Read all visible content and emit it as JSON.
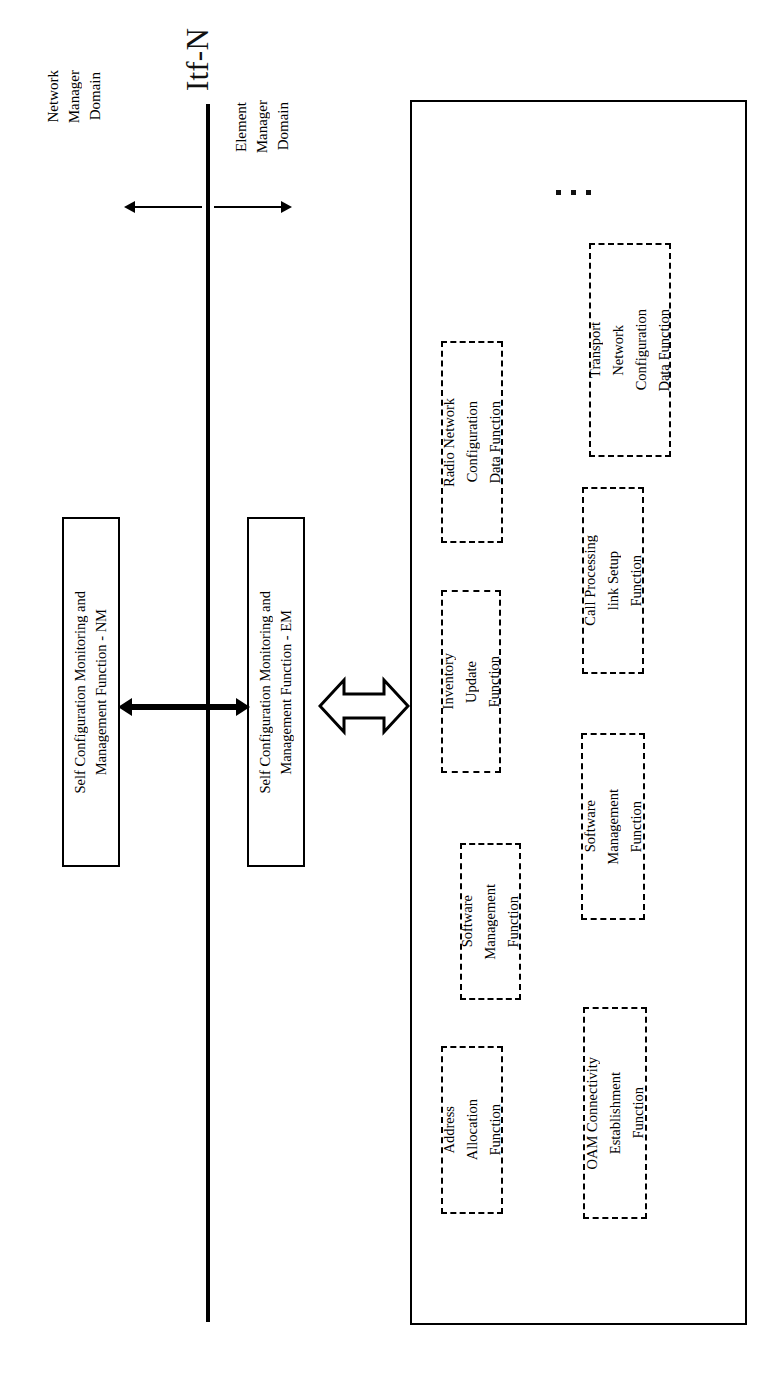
{
  "diagram": {
    "title": "Itf-N",
    "orientation": "rotated-90-ccw",
    "interface_label": "Itf-N",
    "domains": [
      {
        "id": "network-manager",
        "label": "Network\nManager\nDomain",
        "lines": [
          "Network",
          "Manager",
          "Domain"
        ],
        "arrow": "left"
      },
      {
        "id": "element-manager",
        "label": "Element\nManager\nDomain",
        "lines": [
          "Element",
          "Manager",
          "Domain"
        ],
        "arrow": "right"
      }
    ],
    "boxes": {
      "nm_function": {
        "lines": [
          "Self Configuration Monitoring and",
          "Management Function - NM"
        ],
        "style": "solid"
      },
      "em_function": {
        "lines": [
          "Self Configuration Monitoring and",
          "Management Function - EM"
        ],
        "style": "solid"
      },
      "network_element": {
        "label": "",
        "style": "solid-outer"
      }
    },
    "connectors": [
      {
        "id": "nm-em-link",
        "type": "solid-double-arrow",
        "crosses": "Itf-N"
      },
      {
        "id": "em-ne-link",
        "type": "hollow-double-arrow"
      }
    ],
    "functions": [
      {
        "id": "radio-network-configuration-data-function",
        "lines": [
          "Radio Network",
          "Configuration",
          "Data Function"
        ]
      },
      {
        "id": "transport-network-configuration-data-function",
        "lines": [
          "Transport",
          "Network",
          "Configuration",
          "Data Function"
        ]
      },
      {
        "id": "inventory-update-function",
        "lines": [
          "Inventory",
          "Update",
          "Function"
        ]
      },
      {
        "id": "call-processing-link-setup-function",
        "lines": [
          "Call Processing",
          "link Setup",
          "Function"
        ]
      },
      {
        "id": "software-management-function-1",
        "lines": [
          "Software",
          "Management",
          "Function"
        ]
      },
      {
        "id": "software-management-function-2",
        "lines": [
          "Software",
          "Management",
          "Function"
        ]
      },
      {
        "id": "address-allocation-function",
        "lines": [
          "Address",
          "Allocation",
          "Function"
        ]
      },
      {
        "id": "oam-connectivity-establishment-function",
        "lines": [
          "OAM Connectivity",
          "Establishment",
          "Function"
        ]
      }
    ],
    "ellipsis": "⋮",
    "colors": {
      "stroke": "#000000",
      "background": "#ffffff",
      "text": "#111111"
    }
  }
}
